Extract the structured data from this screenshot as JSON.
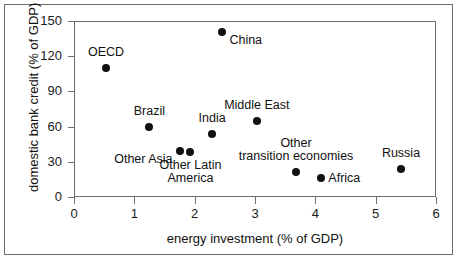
{
  "chart_data": {
    "type": "scatter",
    "title": "",
    "xlabel": "energy investment (% of GDP)",
    "ylabel": "domestic bank credit (% of GDP)",
    "xlim": [
      0,
      6
    ],
    "ylim": [
      0,
      150
    ],
    "xticks": [
      0,
      1,
      2,
      3,
      4,
      5,
      6
    ],
    "yticks": [
      0,
      30,
      60,
      90,
      120,
      150
    ],
    "xtick_labels": [
      "0",
      "1",
      "2",
      "3",
      "4",
      "5",
      "6"
    ],
    "ytick_labels": [
      "0",
      "30",
      "60",
      "90",
      "120",
      "150"
    ],
    "grid": false,
    "legend": "none",
    "points": [
      {
        "label": "OECD",
        "x": 0.53,
        "y": 110,
        "label_pos": "above",
        "label_align": "center"
      },
      {
        "label": "Brazil",
        "x": 1.25,
        "y": 60,
        "label_pos": "above",
        "label_align": "center"
      },
      {
        "label": "Other Asia",
        "x": 1.75,
        "y": 39,
        "label_pos": "below-left",
        "label_align": "right"
      },
      {
        "label": "Other Latin\nAmerica",
        "x": 1.93,
        "y": 38,
        "label_pos": "below",
        "label_align": "center"
      },
      {
        "label": "India",
        "x": 2.29,
        "y": 54,
        "label_pos": "above",
        "label_align": "center"
      },
      {
        "label": "China",
        "x": 2.46,
        "y": 141,
        "label_pos": "below-right",
        "label_align": "left"
      },
      {
        "label": "Middle East",
        "x": 3.03,
        "y": 65,
        "label_pos": "above",
        "label_align": "center"
      },
      {
        "label": "Other\ntransition economies",
        "x": 3.68,
        "y": 21,
        "label_pos": "above",
        "label_align": "center"
      },
      {
        "label": "Africa",
        "x": 4.1,
        "y": 16,
        "label_pos": "right",
        "label_align": "left"
      },
      {
        "label": "Russia",
        "x": 5.42,
        "y": 24,
        "label_pos": "above",
        "label_align": "center"
      }
    ]
  }
}
